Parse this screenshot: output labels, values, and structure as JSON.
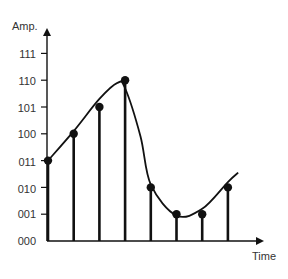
{
  "chart_data": {
    "type": "stem",
    "title": "",
    "xlabel": "Time",
    "ylabel": "Amp.",
    "y_tick_labels": [
      "000",
      "001",
      "010",
      "011",
      "100",
      "101",
      "110",
      "111"
    ],
    "y_tick_values": [
      0,
      1,
      2,
      3,
      4,
      5,
      6,
      7
    ],
    "ylim": [
      0,
      7
    ],
    "grid": false,
    "legend": null,
    "samples": {
      "x": [
        1,
        2,
        3,
        4,
        5,
        6,
        7,
        8
      ],
      "values": [
        3,
        4,
        5,
        6,
        2,
        1,
        1,
        2
      ],
      "binary_labels": [
        "011",
        "100",
        "101",
        "110",
        "010",
        "001",
        "001",
        "010"
      ]
    },
    "continuous_signal": {
      "description": "Smooth analog curve rising from 011 to a peak just below 110, dropping to a minimum near 001, then rising again toward ~010.5",
      "approx_points": [
        [
          1,
          3.0
        ],
        [
          2,
          4.1
        ],
        [
          3,
          5.3
        ],
        [
          3.7,
          5.9
        ],
        [
          4,
          5.7
        ],
        [
          4.6,
          3.9
        ],
        [
          5,
          2.1
        ],
        [
          6,
          0.95
        ],
        [
          7,
          1.2
        ],
        [
          8,
          2.2
        ],
        [
          8.4,
          2.55
        ]
      ]
    }
  },
  "labels": {
    "y_axis": "Amp.",
    "x_axis": "Time",
    "ticks": [
      "111",
      "110",
      "101",
      "100",
      "011",
      "010",
      "001",
      "000"
    ]
  },
  "colors": {
    "line": "#111111",
    "text": "#333333",
    "background": "#ffffff"
  }
}
